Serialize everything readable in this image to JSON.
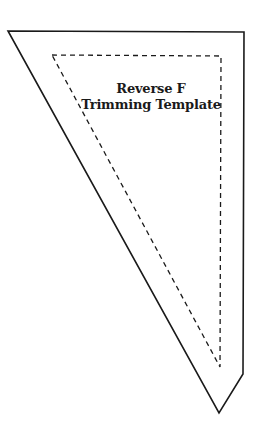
{
  "template": {
    "title_line_1": "Reverse F",
    "title_line_2": "Trimming Template",
    "colors": {
      "background": "#ffffff",
      "outline": "#1a1a1a",
      "seam_line": "#1a1a1a"
    },
    "outer_outline_points": "8,31 244,32 243,374 219,413",
    "inner_dashed_points": "52,55 221,56 220,367"
  }
}
